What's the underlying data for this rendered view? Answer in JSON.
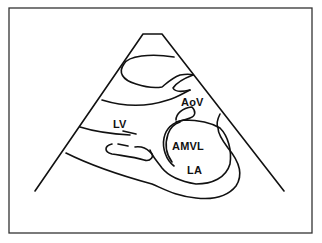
{
  "diagram": {
    "type": "echocardiogram-schematic",
    "view": "parasternal long-axis",
    "colors": {
      "line": "#111111",
      "frame": "#333333",
      "background": "#ffffff"
    },
    "labels": {
      "aov": "AoV",
      "lv": "LV",
      "amvl": "AMVL",
      "la": "LA"
    }
  }
}
